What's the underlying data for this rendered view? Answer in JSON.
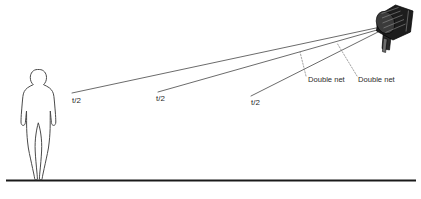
{
  "diagram": {
    "type": "lighting-distance-diagram",
    "colors": {
      "beam_line": "#5a5a5a",
      "leader_line": "#8c8c8c",
      "ground_line": "#1a1a1a",
      "figure_outline": "#4a4a4a",
      "fixture_body": "#1d1d1d",
      "text": "#2b2b2b",
      "background": "#ffffff"
    },
    "subject": {
      "name": "human-figure",
      "label": ""
    },
    "fixture": {
      "name": "studio-light",
      "label": ""
    },
    "ground": {
      "label": ""
    },
    "distance_labels": [
      {
        "text": "t/2",
        "x": 72,
        "y": 103
      },
      {
        "text": "t/2",
        "x": 156,
        "y": 101
      },
      {
        "text": "t/2",
        "x": 251,
        "y": 105
      }
    ],
    "net_labels": [
      {
        "text": "Double net",
        "x": 308,
        "y": 82
      },
      {
        "text": "Double net",
        "x": 358,
        "y": 82
      }
    ],
    "beams": [
      {
        "name": "beam-1",
        "x1": 72,
        "y1": 93,
        "x2": 376,
        "y2": 28
      },
      {
        "name": "beam-2",
        "x1": 158,
        "y1": 92,
        "x2": 377,
        "y2": 30
      },
      {
        "name": "beam-3",
        "x1": 251,
        "y1": 96,
        "x2": 378,
        "y2": 32
      }
    ],
    "leaders": [
      {
        "name": "leader-net-1",
        "x1": 306,
        "y1": 77,
        "x2": 300,
        "y2": 53
      },
      {
        "name": "leader-net-2",
        "x1": 356,
        "y1": 77,
        "x2": 337,
        "y2": 44
      }
    ]
  }
}
